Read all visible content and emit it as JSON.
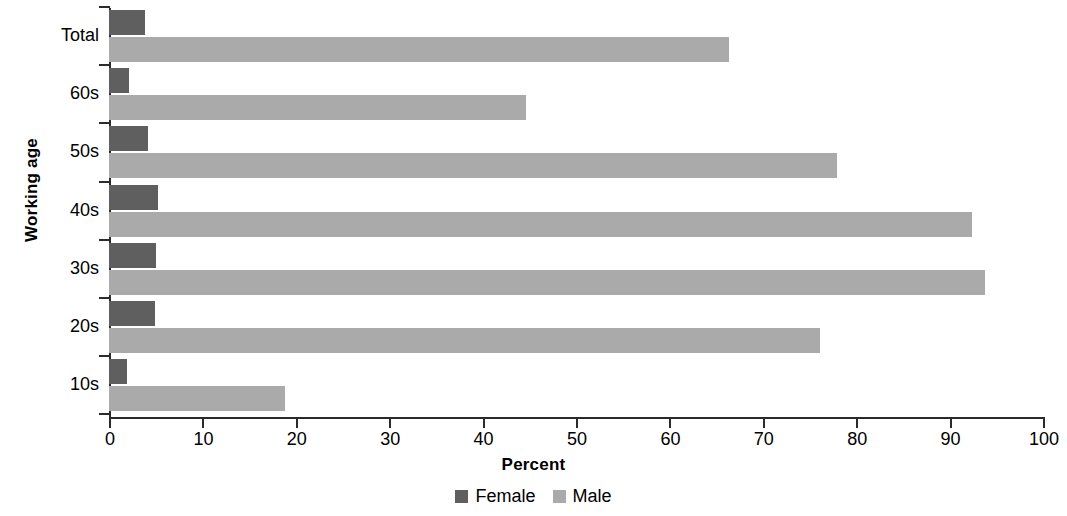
{
  "chart_data": {
    "type": "bar",
    "orientation": "horizontal",
    "title": "",
    "xlabel": "Percent",
    "ylabel": "Working age",
    "xlim": [
      0,
      100
    ],
    "xticks": [
      0,
      10,
      20,
      30,
      40,
      50,
      60,
      70,
      80,
      90,
      100
    ],
    "grid": false,
    "legend_position": "bottom",
    "categories": [
      "Total",
      "60s",
      "50s",
      "40s",
      "30s",
      "20s",
      "10s"
    ],
    "series": [
      {
        "name": "Female",
        "color": "#5f5f5f",
        "values": [
          3.9,
          2.1,
          4.2,
          5.2,
          5.0,
          4.9,
          1.9
        ]
      },
      {
        "name": "Male",
        "color": "#aaaaaa",
        "values": [
          66.4,
          44.6,
          77.9,
          92.4,
          93.8,
          76.1,
          18.8
        ]
      }
    ]
  },
  "axis": {
    "x_title": "Percent",
    "y_title": "Working age",
    "x_tick_labels": [
      "0",
      "10",
      "20",
      "30",
      "40",
      "50",
      "60",
      "70",
      "80",
      "90",
      "100"
    ],
    "y_tick_labels": [
      "Total",
      "60s",
      "50s",
      "40s",
      "30s",
      "20s",
      "10s"
    ]
  },
  "legend": {
    "items": [
      {
        "label": "Female",
        "color": "#5f5f5f"
      },
      {
        "label": "Male",
        "color": "#aaaaaa"
      }
    ]
  }
}
